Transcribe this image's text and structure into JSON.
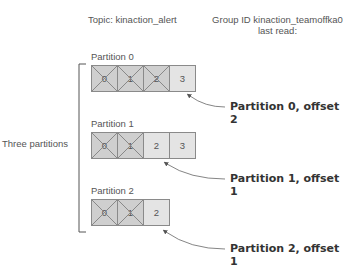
{
  "header": {
    "topic_label": "Topic: kinaction_alert",
    "group_line1": "Group ID kinaction_teamoffka0",
    "group_line2": "last read:"
  },
  "side_label": "Three partitions",
  "partitions": [
    {
      "label": "Partition 0",
      "offsets": [
        "0",
        "1",
        "2",
        "3"
      ],
      "read": [
        true,
        true,
        true,
        false
      ],
      "callout": "Partition 0, offset 2"
    },
    {
      "label": "Partition 1",
      "offsets": [
        "0",
        "1",
        "2",
        "3"
      ],
      "read": [
        true,
        true,
        false,
        false
      ],
      "callout": "Partition 1, offset 1"
    },
    {
      "label": "Partition 2",
      "offsets": [
        "0",
        "1",
        "2"
      ],
      "read": [
        true,
        true,
        false
      ],
      "callout": "Partition 2, offset 1"
    }
  ],
  "colors": {
    "cell_unread": "#e4e4e4",
    "cell_read": "#cfcfcf",
    "border": "#8a8a8a",
    "arrow": "#555555"
  }
}
